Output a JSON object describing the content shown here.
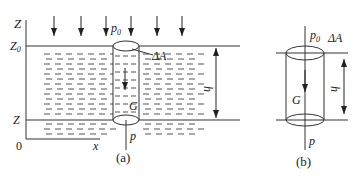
{
  "figure": {
    "panel_a": {
      "caption": "(a)",
      "axis_z_label": "Z",
      "axis_x_label": "x",
      "origin_label": "0",
      "surface_level_label": "Z",
      "surface_level_sub": "0",
      "depth_level_label": "Z",
      "surface_pressure_label": "p",
      "surface_pressure_sub": "0",
      "area_label": "ΔA",
      "weight_label": "G",
      "bottom_pressure_label": "p",
      "depth_label": "h",
      "load_arrow_count": 6
    },
    "panel_b": {
      "caption": "(b)",
      "surface_pressure_label": "p",
      "surface_pressure_sub": "0",
      "area_label": "ΔA",
      "weight_label": "G",
      "bottom_pressure_label": "p",
      "depth_label": "h"
    },
    "colors": {
      "line": "#333333",
      "dash": "#555555",
      "background": "#ffffff"
    }
  }
}
